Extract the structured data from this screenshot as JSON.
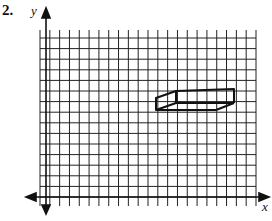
{
  "problem": {
    "number": "2."
  },
  "axes": {
    "x_label": "x",
    "y_label": "y"
  },
  "grid": {
    "x0": 40,
    "x_end": 256,
    "cols": 22,
    "y0": 36,
    "y_end": 206,
    "rows_spacing": 10.6,
    "y_axis_x": 46,
    "x_axis_y": 197,
    "line_color": "#222222"
  },
  "shape": {
    "name": "rectangular prism",
    "front_face": [
      [
        156,
        98
      ],
      [
        176,
        91
      ],
      [
        176,
        103
      ],
      [
        156,
        110
      ]
    ],
    "back_top_edge": [
      [
        176,
        91
      ],
      [
        234,
        89
      ]
    ],
    "stroke_color": "#111111"
  }
}
